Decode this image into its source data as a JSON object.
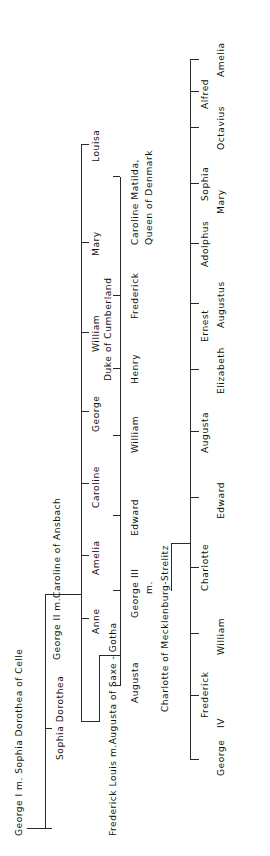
{
  "diagram": {
    "type": "genealogy-tree",
    "orientation": "rotated-90-ccw",
    "line_color": "#2a2a2a",
    "text_color": "#111111",
    "background": "#ffffff"
  },
  "generations": [
    {
      "id": "gen1",
      "couple": "George I m. Sophia Dorothea of Celle",
      "children": [
        {
          "name": "Sophia Dorothea",
          "note": ""
        },
        {
          "name": "George II",
          "note": ""
        }
      ]
    },
    {
      "id": "gen2",
      "couple": "George II m. Caroline of Ansbach",
      "children": [
        {
          "name": "Frederick Louis",
          "note": ""
        },
        {
          "name": "Anne",
          "note": ""
        },
        {
          "name": "Amelia",
          "note": ""
        },
        {
          "name": "Caroline",
          "note": ""
        },
        {
          "name": "George",
          "note": ""
        },
        {
          "name": "William",
          "note": "Duke of Cumberland"
        },
        {
          "name": "Mary",
          "note": ""
        },
        {
          "name": "Louisa",
          "note": ""
        }
      ]
    },
    {
      "id": "gen3",
      "couple": "Frederick Louis m. Augusta of Saxe-Gotha",
      "children": [
        {
          "name": "Augusta",
          "note": ""
        },
        {
          "name": "George III",
          "note": "m."
        },
        {
          "name": "Edward",
          "note": ""
        },
        {
          "name": "William",
          "note": ""
        },
        {
          "name": "Henry",
          "note": ""
        },
        {
          "name": "Frederick",
          "note": ""
        },
        {
          "name": "Caroline Matilda,",
          "note": "Queen of Denmark"
        }
      ],
      "spouse_line": "Charlotte of Mecklenburg-Strelitz"
    },
    {
      "id": "gen4",
      "couple": "George III m. Charlotte of Mecklenburg-Strelitz",
      "children": [
        {
          "name": "George",
          "note": "IV"
        },
        {
          "name": "Frederick",
          "note": ""
        },
        {
          "name": "William",
          "note": ""
        },
        {
          "name": "Charlotte",
          "note": ""
        },
        {
          "name": "Edward",
          "note": ""
        },
        {
          "name": "Augusta",
          "note": ""
        },
        {
          "name": "Elizabeth",
          "note": ""
        },
        {
          "name": "Ernest",
          "note": ""
        },
        {
          "name": "Augustus",
          "note": ""
        },
        {
          "name": "Adolphus",
          "note": ""
        },
        {
          "name": "Mary",
          "note": ""
        },
        {
          "name": "Sophia",
          "note": ""
        },
        {
          "name": "Octavius",
          "note": ""
        },
        {
          "name": "Alfred",
          "note": ""
        },
        {
          "name": "Amelia",
          "note": ""
        }
      ]
    }
  ],
  "labels": {
    "gen1_title": "George I m. Sophia Dorothea of Celle",
    "gen1_child_1": "Sophia Dorothea",
    "gen2_title": "George II m.Caroline of Ansbach",
    "gen2_c_caroline": "Caroline",
    "gen2_c_george": "George",
    "gen2_c_william": "William",
    "gen2_c_william_note": "Duke of Cumberland",
    "gen2_c_mary": "Mary",
    "gen2_c_louisa": "Louisa",
    "gen2_c_anne": "Anne",
    "gen2_c_amelia": "Amelia",
    "gen3_title": "Frederick Louis m.Augusta of Saxe - Gotha",
    "gen3_c_augusta": "Augusta",
    "gen3_c_george3": "George  III",
    "gen3_c_george3_m": "m.",
    "gen3_c_edward": "Edward",
    "gen3_c_william": "William",
    "gen3_c_henry": "Henry",
    "gen3_c_frederick": "Frederick",
    "gen3_c_carolinematilda_1": "Caroline  Matilda,",
    "gen3_c_carolinematilda_2": "Queen of Denmark",
    "gen4_spouse": "Charlotte of Mecklenburg-Strelitz",
    "gen4_c_george4_1": "George",
    "gen4_c_george4_2": "IV",
    "gen4_c_frederick": "Frederick",
    "gen4_c_william": "William",
    "gen4_c_charlotte": "Charlotte",
    "gen4_c_edward": "Edward",
    "gen4_c_augusta": "Augusta",
    "gen4_c_elizabeth": "Elizabeth",
    "gen4_c_ernest": "Ernest",
    "gen4_c_augustus": "Augustus",
    "gen4_c_adolphus": "Adolphus",
    "gen4_c_mary": "Mary",
    "gen4_c_sophia": "Sophia",
    "gen4_c_octavius": "Octavius",
    "gen4_c_alfred": "Alfred",
    "gen4_c_amelia": "Amelia"
  }
}
